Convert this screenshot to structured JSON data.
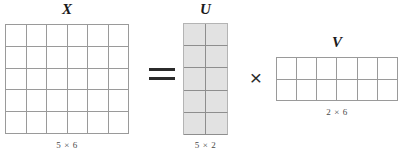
{
  "figure": {
    "kind": "matrix-factorization-diagram",
    "colors": {
      "grid_line": "#9a9a9a",
      "grid_line_light": "#b4b4b4",
      "cell_fill_white": "#ffffff",
      "cell_fill_gray": "#e2e2e2",
      "text": "#1a1a1a",
      "caption_text": "#4a4a4a",
      "operator": "#2b2b2b",
      "background": "#ffffff"
    },
    "matrices": [
      {
        "id": "X",
        "label": "X",
        "caption": "5 × 6",
        "rows": 5,
        "cols": 6,
        "filled": false
      },
      {
        "id": "U",
        "label": "U",
        "caption": "5 × 2",
        "rows": 5,
        "cols": 2,
        "filled": true
      },
      {
        "id": "V",
        "label": "V",
        "caption": "2 × 6",
        "rows": 2,
        "cols": 6,
        "filled": false
      }
    ],
    "operators": {
      "equals": "=",
      "times": "×"
    }
  }
}
